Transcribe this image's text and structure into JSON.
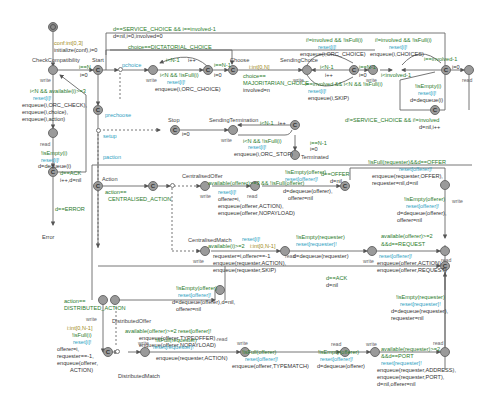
{
  "diagram": {
    "type": "timed-automaton",
    "locations": {
      "initial": {
        "name": ""
      },
      "check_compat": {
        "name": "CheckCompatibility",
        "label": "write"
      },
      "start": {
        "name": "Start"
      },
      "precheck_branch": {
        "name": "prechoose"
      },
      "choose": {
        "name": "Choose"
      },
      "sending_choice": {
        "name": "SendingChoice",
        "label": "write"
      },
      "read_after_check": {
        "name": "",
        "label": "read"
      },
      "ack_check": {
        "name": ""
      },
      "error": {
        "name": "Error"
      },
      "stop": {
        "name": "Stop"
      },
      "sending_termination": {
        "name": "SendingTermination",
        "label": "write"
      },
      "terminated": {
        "name": "Terminated"
      },
      "action": {
        "name": "Action"
      },
      "centralised_offer": {
        "name": "CentralisedOffer",
        "label": "write"
      },
      "centralised_match": {
        "name": "CentralisedMatch",
        "label": "write"
      },
      "distributed_offer": {
        "name": "DistributedOffer",
        "label": "write"
      },
      "distributed_match": {
        "name": "DistributedMatch",
        "label": "write"
      }
    },
    "labels": {
      "init_select": "conf:int[0,3]",
      "init_update": "initialize(conf),i=0",
      "check_guard": "i<N && available(i)>=3",
      "check_reset": "reset[i]!",
      "check_upd1": "enqueue(i,ORC_CHECK),",
      "check_upd2": "enqueue(i,choice),",
      "check_upd3": "enqueue(i,action)",
      "read_label": "read",
      "read_guard": "!isEmpty(i)",
      "read_reset": "reset[i]!",
      "read_upd": "d=dequeue(i)",
      "ack_guard": "d==ACK",
      "ack_upd": "i++,d=nil",
      "error_guard": "d==ERROR",
      "error_name": "Error",
      "start_guard": "i==N",
      "start_upd": "i=0",
      "top_guard": "d==SERVICE_CHOICE && i==involved-1",
      "top_upd": "d=nil,i=0,involved=0",
      "dict_guard": "choice==DICTATORIAL_CHOICE",
      "prechoose": "prechoose",
      "pchoice": "pchoice",
      "loop1_guard": "i<N-1",
      "loop1_upd": "i++",
      "loop1_guard2": "i<N && !isFull(i)",
      "loop1_reset": "reset[i]!",
      "loop1_enq": "enqueue(i,ORC_CHOICE)",
      "choose_guard": "i==N-1",
      "choose_upd": "i=0",
      "maj_select": "i:int[0,N]",
      "maj_guard1": "choice==",
      "maj_guard2": "MAJORITARIAN_CHOICE",
      "maj_upd": "involved=n",
      "sc_guard_top": "i!=involved && !isFull(i)",
      "sc_reset_top": "reset[i]!",
      "sc_enq_top": "enqueue(i,ORC_CHOICE)",
      "sc_loop_guard": "i<N-1",
      "sc_loop_upd": "i++",
      "sc_guard_bot": "i==involved && i<N && !isFull(i)",
      "sc_reset_bot": "reset[i]!",
      "sc_enq_bot": "enqueue(i,SKIP)",
      "sc2_guard": "i==N-1",
      "sc2_upd": "i=0",
      "ch_guard": "i!=involved && !isFull(i)",
      "ch_reset": "reset[i]!",
      "ch_enq": "enqueue(i,CHOICES)",
      "ch_back": "i<involved-1",
      "ch_involved": "i==involved-1",
      "ch_upd": "i=0",
      "right_read": "read",
      "right_guard": "!isEmpty(i)",
      "right_reset": "reset[i]!",
      "right_upd": "d=dequeue(i)",
      "svc_guard": "d!=SERVICE_CHOICE && i!=involved",
      "svc_upd": "d=nil,i++",
      "setup": "setup",
      "paction": "paction",
      "stop_upd": "i=0",
      "term_loop_guard": "i<N-1",
      "term_loop_upd": "i++",
      "term_guard": "i<N && !isFull(i)",
      "term_reset": "reset[i]!",
      "term_enq": "enqueue(i,ORC_STOP)",
      "term_fin_guard": "i==N-1",
      "term_fin_upd": "i=0",
      "terminated": "Terminated",
      "action_guard1": "action==",
      "action_guard2": "CENTRALISED_ACTION",
      "co_guard": "available(offerer)>=3 && !isFull(offerer)",
      "co_reset": "reset[i]!",
      "co_upd1": "offerer=i,",
      "co_upd2": "enqueue(offerer,ACTION),",
      "co_upd3": "enqueue(offerer,NOPAYLOAD)",
      "co_read_guard": "!isEmpty(offerer)",
      "co_read_reset": "reset[offerer]!",
      "co_read_upd1": "d=dequeue(offerer),",
      "co_read_upd2": "offerer=nil",
      "offer_guard": "d==OFFER",
      "offer_upd": "d=nil",
      "cm_guard": "available(i)>=2",
      "cm_select": "i:int[0,N-1]",
      "cm_reset": "reset[i]!",
      "cm_upd1": "requester=i,offerer==-1",
      "cm_upd2": "enqueue(requester,ACTION),",
      "cm_upd3": "enqueue(requester,SKIP)",
      "cm_read_guard": "!isEmpty(requester)",
      "cm_read_reset": "reset[requester]!",
      "cm_read_upd": "d=dequeue(requester)",
      "req_guard1": "available(offerer)>=2",
      "req_guard2": "&&d==REQUEST",
      "req_reset": "reset[offerer]!",
      "req_upd1": "enqueue(offerer,ACTION),",
      "req_upd2": "enqueue(offerer,REQUEST)",
      "req_read": "read",
      "rt_guard": "!isFull(requester)&&d==OFFER",
      "rt_reset": "reset[offerer]!",
      "rt_upd1": "enqueue(requester,OFFER),",
      "rt_upd2": "requester=nil,d=nil",
      "rt_read_guard": "!isEmpty(offerer)",
      "rt_read_reset": "reset[offerer]!",
      "rt_read_upd1": "d=dequeue(offerer),",
      "rt_read_upd2": "offerer=nil",
      "ack2_guard": "d==ACK",
      "ack2_upd": "d=nil",
      "dist_guard1": "action==",
      "dist_guard2": "DISTRIBUTED_ACTION",
      "dist_select": "i:int[0,N-1]",
      "dist_isfull": "!isFull(i)",
      "dist_reset": "reset[i]!",
      "dist_upd1": "offerer=i,",
      "dist_upd2": "requester==-1,",
      "dist_upd3": "enqueue(offerer,",
      "dist_upd4": "ACTION)",
      "do_guard": "available(offerer)>=2 reset[offerer]!",
      "do_upd1": "enqueue(offerer,TYPEOFFER),",
      "do_upd2": "enqueue(offerer,NOPAYLOAD)",
      "do_read_guard": "!isEmpty(offerer)",
      "do_read_reset": "reset[offerer]!",
      "do_read_upd1": "d=dequeue(offerer),d=nil,",
      "do_read_upd2": "offerer=nil",
      "dm_guard": "!isFull(requester)",
      "dm_reset": "reset[requester]!",
      "dm_upd": "enqueue(requester,ACTION)",
      "dm2_guard": "!isFull(offerer)",
      "dm2_reset": "reset[offerer]!",
      "dm2_upd": "enqueue(offerer,TYPEMATCH)",
      "dm3_guard": "!isEmpty(offerer)",
      "dm3_reset": "reset[offerer]!",
      "dm3_upd": "d=dequeue(offerer)",
      "port_guard1": "available(requester)>=2",
      "port_guard2": "&&d==PORT",
      "port_reset": "reset[requester]!",
      "port_upd1": "enqueue(requester,ADDRESS),",
      "port_upd2": "enqueue(requester,PORT),",
      "port_upd3": "d=nil,offerer=nil",
      "ret_guard": "!isEmpty(requester)",
      "ret_reset": "reset[requester]!",
      "ret_upd1": "d=dequeue(requester),",
      "ret_upd2": "requester=nil",
      "write": "write",
      "read": "read"
    },
    "colors": {
      "location_fill": "#9a9a9a",
      "edge": "#555555",
      "guard": "#2a7a2a",
      "sync": "#2f9fbf",
      "update": "#333333"
    }
  }
}
